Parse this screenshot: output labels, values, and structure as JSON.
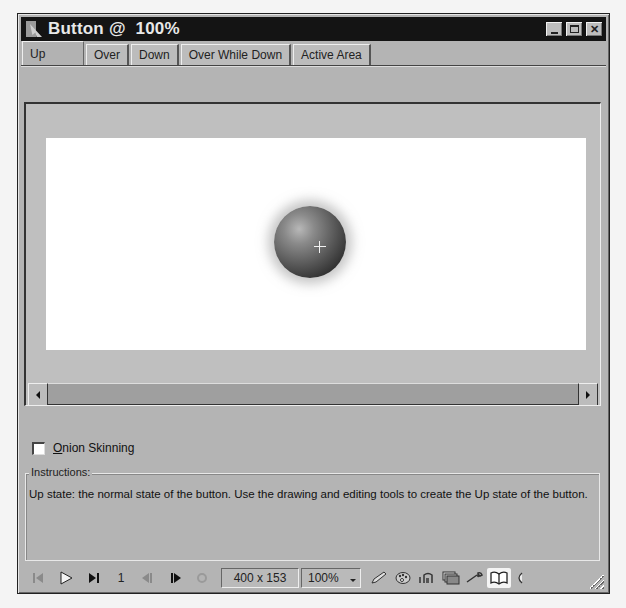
{
  "window": {
    "title": "Button @  100%",
    "controls": [
      "minimize",
      "maximize",
      "close"
    ]
  },
  "tabs": [
    {
      "label": "Up",
      "active": true
    },
    {
      "label": "Over",
      "active": false
    },
    {
      "label": "Down",
      "active": false
    },
    {
      "label": "Over While Down",
      "active": false
    },
    {
      "label": "Active Area",
      "active": false
    }
  ],
  "stage": {
    "canvas_color": "#ffffff",
    "object": "sphere-button"
  },
  "onion_skinning": {
    "label": "Onion Skinning",
    "mnemonic": "O",
    "rest": "nion Skinning",
    "checked": false
  },
  "instructions": {
    "legend": "Instructions:",
    "text": "Up state: the normal state of the button. Use the drawing and editing tools to create the Up state of the button."
  },
  "statusbar": {
    "frame": "1",
    "stage_size": "400 x 153",
    "zoom": "100%",
    "icons": [
      "first-frame-icon",
      "play-icon",
      "last-frame-icon",
      "prev-frame-icon",
      "next-frame-icon",
      "loop-icon",
      "pencil-icon",
      "palette-icon",
      "actions-icon",
      "library-icon",
      "wrench-icon",
      "book-icon",
      "sound-icon"
    ]
  }
}
